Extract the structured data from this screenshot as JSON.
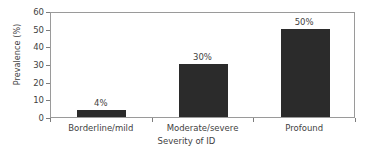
{
  "chart_data": {
    "type": "bar",
    "title": "",
    "subtitle": "",
    "xlabel": "Severity of ID",
    "ylabel": "Prevalence (%)",
    "categories": [
      "Borderline/mild",
      "Moderate/severe",
      "Profound"
    ],
    "values": [
      4,
      30,
      50
    ],
    "value_labels": [
      "4%",
      "30%",
      "50%"
    ],
    "ylim": [
      0,
      60
    ],
    "yticks": [
      0,
      10,
      20,
      30,
      40,
      50,
      60
    ],
    "ytick_labels": [
      "0",
      "10",
      "20",
      "30",
      "40",
      "50",
      "60"
    ],
    "grid": false,
    "legend": null,
    "legend_position": "none",
    "bar_color": "#2b2b2b",
    "axis_color": "#9a9a9a",
    "text_color": "#3f3f3f",
    "background_color": "#ffffff",
    "annotations": []
  }
}
